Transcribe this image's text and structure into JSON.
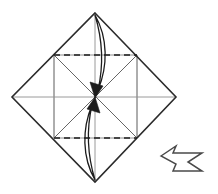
{
  "diagram": {
    "title": "Origami fold step: blintz fold of square base",
    "type": "origami-instruction",
    "canvas": {
      "width": 218,
      "height": 194,
      "background": "#ffffff"
    },
    "colors": {
      "outline": "#2b2b2b",
      "crease_existing": "#9a9a9a",
      "fold_line_dashed": "#1c1c1c",
      "arrow_stroke": "#1c1c1c",
      "arrow_fill": "#1c1c1c",
      "step_arrow_stroke": "#4a4a4a",
      "step_arrow_fill": "#ffffff"
    },
    "shapes": {
      "outer_diamond": {
        "label": "square paper rotated 45 degrees",
        "vertices": [
          {
            "name": "top",
            "x": 95,
            "y": 13
          },
          {
            "name": "right",
            "x": 176,
            "y": 97
          },
          {
            "name": "bottom",
            "x": 95,
            "y": 182
          },
          {
            "name": "left",
            "x": 12,
            "y": 97
          }
        ],
        "stroke_width": 1.6
      },
      "inner_square": {
        "label": "existing crease square joining edge midpoints",
        "vertices": [
          {
            "name": "top-left",
            "x": 54,
            "y": 55
          },
          {
            "name": "top-right",
            "x": 137,
            "y": 55
          },
          {
            "name": "bottom-right",
            "x": 137,
            "y": 138
          },
          {
            "name": "bottom-left",
            "x": 54,
            "y": 138
          }
        ],
        "stroke_width": 1.0
      },
      "center_point": {
        "x": 95,
        "y": 97,
        "label": "center of paper"
      }
    },
    "creases": [
      {
        "name": "diagonal-top-left-to-bottom-right",
        "x1": 12,
        "y1": 97,
        "x2": 176,
        "y2": 97,
        "style": "solid-grey"
      },
      {
        "name": "diagonal-top-to-bottom",
        "x1": 95,
        "y1": 13,
        "x2": 95,
        "y2": 182,
        "style": "solid-grey"
      },
      {
        "name": "crease-upper-left-edge-to-center",
        "x1": 54,
        "y1": 55,
        "x2": 137,
        "y2": 138,
        "style": "solid-grey"
      },
      {
        "name": "crease-upper-right-edge-to-center",
        "x1": 137,
        "y1": 55,
        "x2": 54,
        "y2": 138,
        "style": "solid-grey"
      },
      {
        "name": "crease-vertical-left",
        "x1": 54,
        "y1": 55,
        "x2": 54,
        "y2": 138,
        "style": "solid-grey"
      },
      {
        "name": "crease-vertical-right",
        "x1": 137,
        "y1": 55,
        "x2": 137,
        "y2": 138,
        "style": "solid-grey"
      }
    ],
    "fold_lines": [
      {
        "name": "upper-valley-fold-line",
        "x1": 54,
        "y1": 55,
        "x2": 137,
        "y2": 55,
        "style": "dashed",
        "dash": "6 4"
      },
      {
        "name": "lower-valley-fold-line",
        "x1": 54,
        "y1": 138,
        "x2": 137,
        "y2": 138,
        "style": "dashed",
        "dash": "6 4"
      }
    ],
    "fold_arrows": [
      {
        "name": "top-flap-fold-arrow",
        "direction": "down",
        "from": {
          "x": 95,
          "y": 15
        },
        "to": {
          "x": 95,
          "y": 97
        },
        "shape": "lens",
        "description": "fold top corner down to center"
      },
      {
        "name": "bottom-flap-fold-arrow",
        "direction": "up",
        "from": {
          "x": 95,
          "y": 180
        },
        "to": {
          "x": 95,
          "y": 97
        },
        "shape": "lens",
        "description": "fold bottom corner up to center"
      }
    ],
    "step_arrow": {
      "name": "next-step-arrow",
      "direction": "right",
      "description": "proceed to next step",
      "center": {
        "x": 183,
        "y": 159
      }
    }
  }
}
